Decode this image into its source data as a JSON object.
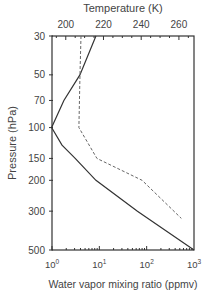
{
  "chart_data": {
    "type": "line",
    "title": "",
    "top_axis": {
      "label": "Temperature (K)",
      "ticks": [
        200,
        220,
        240,
        260
      ],
      "range": [
        192.7,
        268
      ]
    },
    "bottom_axis": {
      "label": "Water vapor mixing ratio (ppmv)",
      "scale": "log",
      "ticks": [
        "10^0",
        "10^1",
        "10^2",
        "10^3"
      ],
      "range": [
        1,
        1000
      ]
    },
    "y_axis": {
      "label": "Pressure (hPa)",
      "scale": "log",
      "inverted": true,
      "ticks": [
        30,
        50,
        70,
        100,
        150,
        200,
        300,
        500
      ],
      "range": [
        30,
        500
      ]
    },
    "series": [
      {
        "name": "Temperature",
        "axis": "top",
        "style": "solid",
        "points": [
          [
            30,
            216
          ],
          [
            50,
            207.5
          ],
          [
            70,
            199
          ],
          [
            100,
            192.5
          ],
          [
            126,
            198
          ],
          [
            150,
            205
          ],
          [
            200,
            216
          ],
          [
            300,
            238
          ],
          [
            500,
            268
          ]
        ]
      },
      {
        "name": "Water vapor",
        "axis": "bottom",
        "style": "dashed",
        "points": [
          [
            30,
            4.1
          ],
          [
            50,
            3.9
          ],
          [
            100,
            3.7
          ],
          [
            150,
            8.9
          ],
          [
            200,
            80
          ],
          [
            330,
            540
          ]
        ]
      }
    ]
  },
  "labels": {
    "top": "Temperature (K)",
    "left": "Pressure (hPa)",
    "bottom": "Water vapor mixing ratio (ppmv)"
  }
}
